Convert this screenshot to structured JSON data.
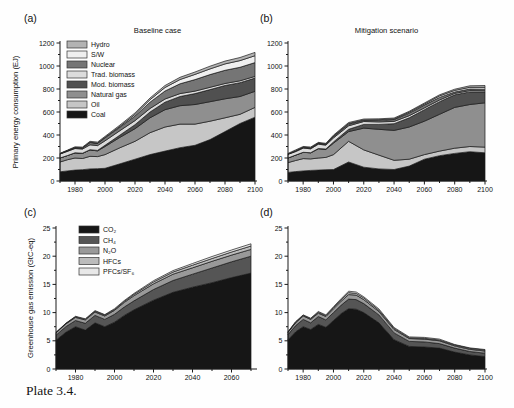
{
  "caption": {
    "text": "Plate 3.4."
  },
  "chart_data": [
    {
      "id": "a",
      "panel_label": "(a)",
      "title": "Baseline case",
      "ylabel": "Primary energy consumption (EJ)",
      "type": "area",
      "stacked": true,
      "grid": false,
      "xlim": [
        1970,
        2100
      ],
      "ylim": [
        0,
        1200
      ],
      "xticks": [
        1980,
        2000,
        2020,
        2040,
        2060,
        2080,
        2100
      ],
      "yticks": [
        0,
        200,
        400,
        600,
        800,
        1000,
        1200
      ],
      "x": [
        1970,
        1975,
        1980,
        1985,
        1990,
        1995,
        2000,
        2010,
        2020,
        2030,
        2040,
        2050,
        2060,
        2070,
        2080,
        2090,
        2100
      ],
      "series": [
        {
          "name": "Coal",
          "color": "#161616",
          "values": [
            80,
            88,
            95,
            98,
            105,
            107,
            110,
            150,
            190,
            230,
            260,
            290,
            310,
            360,
            430,
            500,
            555
          ]
        },
        {
          "name": "Oil",
          "color": "#c6c6c6",
          "values": [
            85,
            97,
            105,
            98,
            110,
            105,
            120,
            140,
            155,
            190,
            210,
            205,
            185,
            160,
            120,
            80,
            85
          ]
        },
        {
          "name": "Natural gas",
          "color": "#8f8f8f",
          "values": [
            35,
            37,
            45,
            44,
            55,
            50,
            70,
            90,
            110,
            130,
            150,
            160,
            170,
            170,
            165,
            155,
            140
          ]
        },
        {
          "name": "Mod. biomass",
          "color": "#505050",
          "values": [
            0,
            0,
            0,
            2,
            2,
            4,
            10,
            20,
            35,
            50,
            65,
            80,
            95,
            105,
            115,
            120,
            115
          ]
        },
        {
          "name": "Trad. biomass",
          "color": "#dcdcdc",
          "values": [
            35,
            36,
            38,
            36,
            43,
            42,
            40,
            38,
            35,
            30,
            28,
            25,
            22,
            20,
            18,
            16,
            15
          ]
        },
        {
          "name": "Nuclear",
          "color": "#757575",
          "values": [
            2,
            5,
            7,
            10,
            20,
            20,
            25,
            30,
            40,
            55,
            70,
            85,
            100,
            110,
            115,
            118,
            120
          ]
        },
        {
          "name": "S/W",
          "color": "#efefef",
          "values": [
            0,
            1,
            1,
            1,
            2,
            2,
            4,
            8,
            14,
            22,
            30,
            38,
            45,
            50,
            55,
            58,
            60
          ]
        },
        {
          "name": "Hydro",
          "color": "#b3b3b3",
          "values": [
            4,
            5,
            6,
            6,
            8,
            8,
            9,
            11,
            13,
            15,
            17,
            19,
            21,
            23,
            25,
            27,
            28
          ]
        }
      ],
      "legend": [
        "Hydro",
        "S/W",
        "Nuclear",
        "Trad. biomass",
        "Mod. biomass",
        "Natural gas",
        "Oil",
        "Coal"
      ]
    },
    {
      "id": "b",
      "panel_label": "(b)",
      "title": "Mitigation scenario",
      "ylabel": "",
      "type": "area",
      "stacked": true,
      "grid": false,
      "xlim": [
        1970,
        2100
      ],
      "ylim": [
        0,
        1200
      ],
      "xticks": [
        1980,
        2000,
        2020,
        2040,
        2060,
        2080,
        2100
      ],
      "yticks": [
        0,
        200,
        400,
        600,
        800,
        1000,
        1200
      ],
      "x": [
        1970,
        1975,
        1980,
        1985,
        1990,
        1995,
        2000,
        2010,
        2020,
        2030,
        2040,
        2050,
        2060,
        2070,
        2080,
        2090,
        2100
      ],
      "series": [
        {
          "name": "Coal",
          "color": "#161616",
          "values": [
            75,
            82,
            88,
            92,
            95,
            98,
            100,
            165,
            120,
            105,
            100,
            130,
            190,
            220,
            240,
            255,
            245
          ]
        },
        {
          "name": "Oil",
          "color": "#c6c6c6",
          "values": [
            85,
            96,
            107,
            100,
            105,
            107,
            130,
            180,
            150,
            120,
            80,
            60,
            40,
            40,
            45,
            45,
            50
          ]
        },
        {
          "name": "Natural gas",
          "color": "#8f8f8f",
          "values": [
            40,
            47,
            55,
            53,
            80,
            70,
            100,
            85,
            190,
            225,
            260,
            280,
            290,
            320,
            355,
            365,
            385
          ]
        },
        {
          "name": "Mod. biomass",
          "color": "#505050",
          "values": [
            0,
            0,
            0,
            1,
            3,
            3,
            10,
            20,
            32,
            42,
            58,
            80,
            100,
            110,
            110,
            110,
            95
          ]
        },
        {
          "name": "Trad. biomass",
          "color": "#dcdcdc",
          "values": [
            32,
            31,
            36,
            34,
            37,
            34,
            35,
            30,
            25,
            22,
            20,
            18,
            16,
            14,
            12,
            11,
            10
          ]
        },
        {
          "name": "Nuclear",
          "color": "#757575",
          "values": [
            2,
            6,
            7,
            8,
            8,
            8,
            12,
            14,
            10,
            13,
            17,
            22,
            24,
            23,
            12,
            14,
            13
          ]
        },
        {
          "name": "S/W",
          "color": "#efefef",
          "values": [
            0,
            1,
            1,
            1,
            2,
            2,
            4,
            6,
            4,
            6,
            5,
            8,
            10,
            13,
            14,
            15,
            17
          ]
        },
        {
          "name": "Hydro",
          "color": "#b3b3b3",
          "values": [
            6,
            7,
            6,
            7,
            6,
            6,
            8,
            9,
            8,
            8,
            8,
            8,
            8,
            10,
            10,
            13,
            15
          ]
        }
      ],
      "legend": []
    },
    {
      "id": "c",
      "panel_label": "(c)",
      "title": "",
      "ylabel": "Greenhouse gas emission (GtC-eq)",
      "type": "area",
      "stacked": true,
      "grid": false,
      "xlim": [
        1970,
        2070
      ],
      "ylim": [
        0,
        25
      ],
      "xticks": [
        1980,
        2000,
        2020,
        2040,
        2060
      ],
      "yticks": [
        0,
        5,
        10,
        15,
        20,
        25
      ],
      "x": [
        1970,
        1975,
        1980,
        1985,
        1990,
        1995,
        2000,
        2005,
        2010,
        2020,
        2030,
        2040,
        2050,
        2060,
        2070
      ],
      "series": [
        {
          "name": "CO₂",
          "color": "#161616",
          "values": [
            5.1,
            6.5,
            7.5,
            6.9,
            8.2,
            7.5,
            8.3,
            9.5,
            10.5,
            12.2,
            13.6,
            14.5,
            15.3,
            16.2,
            17.0
          ]
        },
        {
          "name": "CH₄",
          "color": "#555555",
          "values": [
            0.9,
            1.0,
            1.1,
            1.2,
            1.3,
            1.3,
            1.4,
            1.5,
            1.6,
            1.9,
            2.1,
            2.3,
            2.6,
            2.8,
            3.0
          ]
        },
        {
          "name": "N₂O",
          "color": "#999999",
          "values": [
            0.4,
            0.5,
            0.55,
            0.6,
            0.6,
            0.6,
            0.7,
            0.8,
            0.9,
            1.0,
            1.1,
            1.15,
            1.2,
            1.2,
            1.2
          ]
        },
        {
          "name": "HFCs",
          "color": "#bcbcbc",
          "values": [
            0.05,
            0.05,
            0.1,
            0.1,
            0.15,
            0.15,
            0.15,
            0.2,
            0.25,
            0.35,
            0.4,
            0.45,
            0.5,
            0.55,
            0.6
          ]
        },
        {
          "name": "PFCs/SF₆",
          "color": "#e8e8e8",
          "values": [
            0.05,
            0.05,
            0.1,
            0.1,
            0.1,
            0.1,
            0.15,
            0.15,
            0.15,
            0.2,
            0.25,
            0.3,
            0.35,
            0.35,
            0.4
          ]
        }
      ],
      "legend": [
        "CO₂",
        "CH₄",
        "N₂O",
        "HFCs",
        "PFCs/SF₆"
      ]
    },
    {
      "id": "d",
      "panel_label": "(d)",
      "title": "",
      "ylabel": "",
      "type": "area",
      "stacked": true,
      "grid": false,
      "xlim": [
        1970,
        2100
      ],
      "ylim": [
        0,
        25
      ],
      "xticks": [
        1980,
        2000,
        2020,
        2040,
        2060,
        2080,
        2100
      ],
      "yticks": [
        0,
        5,
        10,
        15,
        20,
        25
      ],
      "x": [
        1970,
        1975,
        1980,
        1985,
        1990,
        1995,
        2000,
        2005,
        2010,
        2015,
        2020,
        2030,
        2040,
        2050,
        2060,
        2070,
        2080,
        2090,
        2100
      ],
      "series": [
        {
          "name": "CO₂",
          "color": "#161616",
          "values": [
            5.2,
            6.6,
            7.5,
            7.0,
            7.9,
            7.4,
            8.6,
            9.8,
            10.7,
            10.6,
            10.0,
            8.2,
            5.2,
            4.0,
            3.9,
            3.7,
            3.0,
            2.5,
            2.2
          ]
        },
        {
          "name": "CH₄",
          "color": "#555555",
          "values": [
            0.9,
            1.1,
            1.3,
            1.2,
            1.4,
            1.3,
            1.4,
            1.5,
            1.7,
            1.7,
            1.6,
            1.4,
            1.2,
            0.9,
            0.9,
            0.8,
            0.7,
            0.6,
            0.6
          ]
        },
        {
          "name": "N₂O",
          "color": "#999999",
          "values": [
            0.4,
            0.5,
            0.6,
            0.6,
            0.6,
            0.6,
            0.7,
            0.7,
            0.8,
            0.8,
            0.7,
            0.6,
            0.6,
            0.5,
            0.5,
            0.5,
            0.4,
            0.4,
            0.4
          ]
        },
        {
          "name": "HFCs",
          "color": "#bcbcbc",
          "values": [
            0.05,
            0.1,
            0.1,
            0.1,
            0.15,
            0.15,
            0.2,
            0.25,
            0.35,
            0.3,
            0.3,
            0.25,
            0.2,
            0.15,
            0.15,
            0.15,
            0.15,
            0.15,
            0.15
          ]
        },
        {
          "name": "PFCs/SF₆",
          "color": "#e8e8e8",
          "values": [
            0.05,
            0.1,
            0.1,
            0.1,
            0.15,
            0.15,
            0.15,
            0.2,
            0.25,
            0.25,
            0.2,
            0.2,
            0.15,
            0.15,
            0.15,
            0.15,
            0.1,
            0.1,
            0.1
          ]
        }
      ],
      "legend": []
    }
  ]
}
